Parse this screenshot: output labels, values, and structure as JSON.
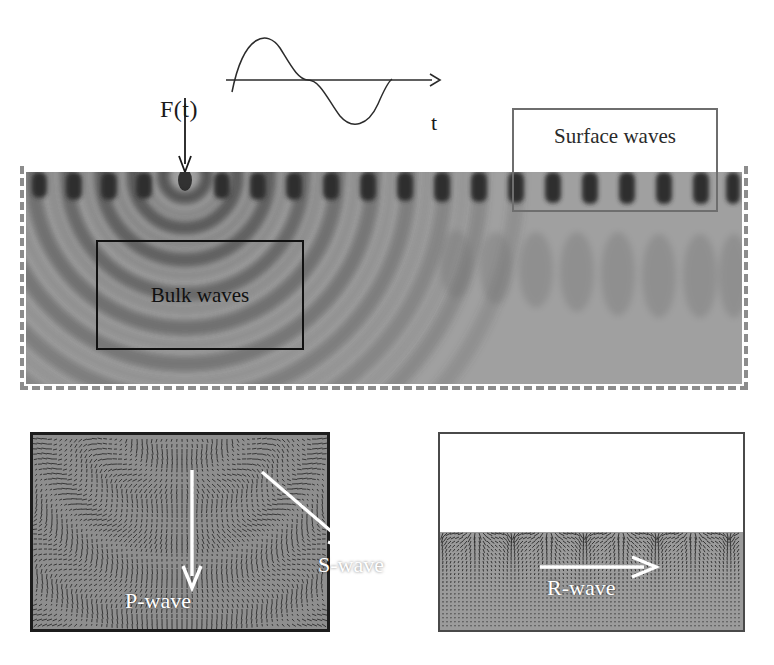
{
  "figure": {
    "background": "#ffffff"
  },
  "source_function": {
    "amplitude_label": "F(t)",
    "time_axis_label": "t",
    "waveform": "one-cycle-sine",
    "cycles": 1
  },
  "main_panel": {
    "name": "wavefield-snapshot",
    "source_marker": "point-source",
    "boundary_style": "dashed-absorbing",
    "boundary_color": "#8c8c8c",
    "annotations": [
      {
        "id": "bulk-waves",
        "label": "Bulk waves",
        "border_color": "#111111"
      },
      {
        "id": "surface-waves",
        "label": "Surface waves",
        "border_color": "#6e6e6e"
      }
    ]
  },
  "detail_panels": [
    {
      "id": "bulk-detail",
      "name": "bulk-wave-displacement-field",
      "border_color": "#1c1c1c",
      "arrows": [
        {
          "id": "p-wave",
          "label": "P-wave",
          "direction": "down",
          "color": "#ffffff"
        },
        {
          "id": "s-wave",
          "label": "S-wave",
          "direction": "down-right",
          "color": "#ffffff"
        }
      ]
    },
    {
      "id": "surface-detail",
      "name": "rayleigh-wave-displacement-field",
      "border_color": "#4a4a4a",
      "arrows": [
        {
          "id": "r-wave",
          "label": "R-wave",
          "direction": "right",
          "color": "#ffffff"
        }
      ]
    }
  ],
  "chart_data": {
    "type": "line",
    "title": "",
    "xlabel": "t",
    "ylabel": "F(t)",
    "series": [
      {
        "name": "F(t)",
        "description": "single sine cycle source time function"
      }
    ],
    "grid": false,
    "legend": "none"
  }
}
